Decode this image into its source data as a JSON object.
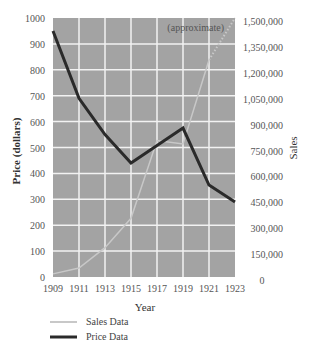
{
  "chart_data": {
    "type": "line",
    "title": "",
    "xlabel": "Year",
    "ylabel": "Price (dollars)",
    "y2label": "Sales",
    "annotation": "(approximate)",
    "x": [
      1909,
      1911,
      1913,
      1915,
      1917,
      1919,
      1921,
      1923
    ],
    "x_ticks": [
      "1909",
      "1911",
      "1913",
      "1915",
      "1917",
      "1919",
      "1921",
      "1923"
    ],
    "ylim": [
      0,
      1000
    ],
    "y_ticks": [
      "0",
      "100",
      "200",
      "300",
      "400",
      "500",
      "600",
      "700",
      "800",
      "900",
      "1000"
    ],
    "y2lim": [
      0,
      1500000
    ],
    "y2_ticks": [
      "0",
      "150,000",
      "300,000",
      "450,000",
      "600,000",
      "750,000",
      "900,000",
      "1,050,000",
      "1,200,000",
      "1,350,000",
      "1,500,000"
    ],
    "grid": true,
    "legend_position": "bottom-left",
    "series": [
      {
        "name": "Sales Data",
        "axis": "right",
        "color": "#c8c8c8",
        "values": [
          18000,
          52000,
          170000,
          340000,
          790000,
          770000,
          1257000,
          1500000
        ],
        "dotted_from_index": 6
      },
      {
        "name": "Price Data",
        "axis": "left",
        "color": "#2a2a2a",
        "values": [
          950,
          690,
          550,
          440,
          508,
          575,
          355,
          290
        ]
      }
    ]
  },
  "legend": {
    "items": [
      {
        "label": "Sales Data",
        "color": "#c8c8c8"
      },
      {
        "label": "Price Data",
        "color": "#2a2a2a"
      }
    ]
  },
  "colors": {
    "plot_background": "#a3a3a3",
    "grid": "#f2f2f2"
  }
}
